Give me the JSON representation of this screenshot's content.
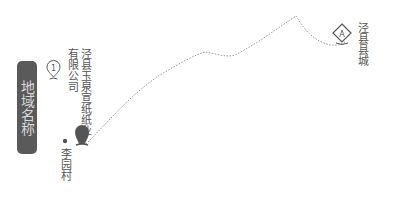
{
  "legend": {
    "label": "地域名称"
  },
  "markers": [
    {
      "id": "start",
      "badge": "1",
      "icon": "numbered-pin-icon"
    },
    {
      "id": "company",
      "icon": "filled-pin-icon",
      "label": "泾县玉泉宣纸纸业有限公司",
      "label_lines": [
        "泾县玉泉宣纸",
        "纸业有限公司"
      ]
    },
    {
      "id": "village",
      "icon": "dot-icon",
      "label": "李园村"
    },
    {
      "id": "county",
      "badge": "A",
      "icon": "diamond-pin-icon",
      "label": "泾县县城"
    }
  ],
  "route": {
    "style": "dotted",
    "color": "#999999"
  },
  "colors": {
    "badge_bg": "#5a5a5a",
    "badge_text": "#d8d8d8",
    "pin_fill": "#555555",
    "text": "#555555"
  }
}
